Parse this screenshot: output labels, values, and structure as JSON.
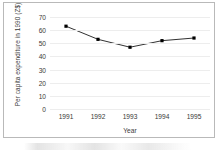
{
  "chart_data": {
    "type": "line",
    "title": "",
    "xlabel": "Year",
    "ylabel": "Per capita expenditure in 1990 (Z$)",
    "categories": [
      "1991",
      "1992",
      "1993",
      "1994",
      "1995"
    ],
    "values": [
      63,
      53,
      47,
      52,
      54
    ],
    "series": [
      {
        "name": "Per capita expenditure",
        "values": [
          63,
          53,
          47,
          52,
          54
        ]
      }
    ],
    "ylim": [
      0,
      70
    ],
    "yticks": [
      0,
      10,
      20,
      30,
      40,
      50,
      60,
      70
    ],
    "ytick_labels": [
      "0",
      "10",
      "20",
      "30",
      "40",
      "50",
      "60",
      "70"
    ],
    "xtick_labels": [
      "1991",
      "1992",
      "1993",
      "1994",
      "1995"
    ],
    "grid": true,
    "grid_axis": "y",
    "legend": false,
    "legend_position": "none",
    "marker": "square",
    "marker_color": "#000000",
    "line_color": "#1a1a1a",
    "grid_color": "#ededed",
    "background_color": "#ffffff",
    "frame_color": "#b9b9b9",
    "text_color": "#3a3a3a"
  },
  "axis": {
    "y_title": "Per capita expenditure in 1990 (Z$)",
    "x_title": "Year"
  }
}
